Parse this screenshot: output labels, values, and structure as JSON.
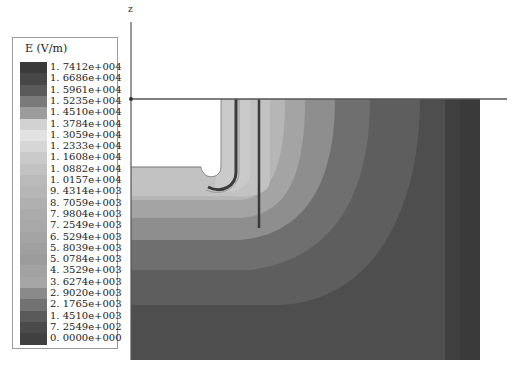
{
  "figure": {
    "axis_label_z": "z",
    "legend": {
      "title": "E (V/m)",
      "entries": [
        {
          "label": "1. 7412e+004",
          "color": "#3a3a3a"
        },
        {
          "label": "1. 6686e+004",
          "color": "#474747"
        },
        {
          "label": "1. 5961e+004",
          "color": "#5a5a5a"
        },
        {
          "label": "1. 5235e+004",
          "color": "#7a7a7a"
        },
        {
          "label": "1. 4510e+004",
          "color": "#9c9c9c"
        },
        {
          "label": "1. 3784e+004",
          "color": "#d2d2d2"
        },
        {
          "label": "1. 3059e+004",
          "color": "#e2e2e2"
        },
        {
          "label": "1. 2333e+004",
          "color": "#d6d6d6"
        },
        {
          "label": "1. 1608e+004",
          "color": "#cacaca"
        },
        {
          "label": "1. 0882e+004",
          "color": "#c2c2c2"
        },
        {
          "label": "1. 0157e+004",
          "color": "#bababa"
        },
        {
          "label": "9. 4314e+003",
          "color": "#b6b6b6"
        },
        {
          "label": "8. 7059e+003",
          "color": "#b0b0b0"
        },
        {
          "label": "7. 9804e+003",
          "color": "#ababab"
        },
        {
          "label": "7. 2549e+003",
          "color": "#a8a8a8"
        },
        {
          "label": "6. 5294e+003",
          "color": "#a4a4a4"
        },
        {
          "label": "5. 8039e+003",
          "color": "#a0a0a0"
        },
        {
          "label": "5. 0784e+003",
          "color": "#9c9c9c"
        },
        {
          "label": "4. 3529e+003",
          "color": "#a2a2a2"
        },
        {
          "label": "3. 6274e+003",
          "color": "#a6a6a6"
        },
        {
          "label": "2. 9020e+003",
          "color": "#8a8a8a"
        },
        {
          "label": "2. 1765e+003",
          "color": "#727272"
        },
        {
          "label": "1. 4510e+003",
          "color": "#5a5a5a"
        },
        {
          "label": "7. 2549e+002",
          "color": "#4a4a4a"
        },
        {
          "label": "0. 0000e+000",
          "color": "#404040"
        }
      ]
    },
    "colors": {
      "band_lightest": "#c4c4c4",
      "band_light": "#b4b4b4",
      "band_mid_light": "#a2a2a2",
      "band_mid": "#8c8c8c",
      "band_mid_dark": "#6e6e6e",
      "band_dark": "#5c5c5c",
      "band_darkest": "#4a4a4a",
      "edge_strip": "#404040",
      "conductor": "#3a3a3a",
      "axis": "#555555"
    }
  }
}
